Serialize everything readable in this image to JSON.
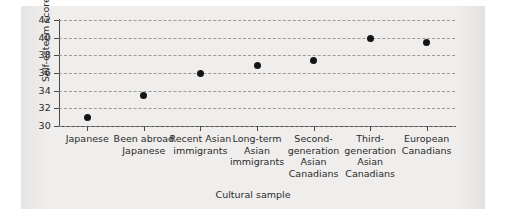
{
  "chart_data": {
    "type": "scatter",
    "title": "",
    "xlabel": "Cultural sample",
    "ylabel": "Self-esteem score",
    "ylim": [
      30,
      42
    ],
    "ytick_step": 2,
    "yticks": [
      42,
      40,
      38,
      36,
      34,
      32,
      30
    ],
    "grid": true,
    "legend": "none",
    "categories": [
      "Japanese",
      "Been abroad Japanese",
      "Recent Asian immigrants",
      "Long-term Asian immigrants",
      "Second-generation Asian Canadians",
      "Third-generation Asian Canadians",
      "European Canadians"
    ],
    "category_lines": [
      [
        "Japanese"
      ],
      [
        "Been abroad",
        "Japanese"
      ],
      [
        "Recent Asian",
        "immigrants"
      ],
      [
        "Long-term",
        "Asian",
        "immigrants"
      ],
      [
        "Second-",
        "generation",
        "Asian",
        "Canadians"
      ],
      [
        "Third-",
        "generation",
        "Asian",
        "Canadians"
      ],
      [
        "European",
        "Canadians"
      ]
    ],
    "values": [
      31.0,
      33.4,
      36.0,
      36.9,
      37.4,
      39.9,
      39.5
    ],
    "marker": "filled-circle",
    "marker_color": "#151515",
    "axis_color": "#4a4a4a",
    "gridline_color": "#8d8d8d",
    "background_color": "#efeeec"
  }
}
